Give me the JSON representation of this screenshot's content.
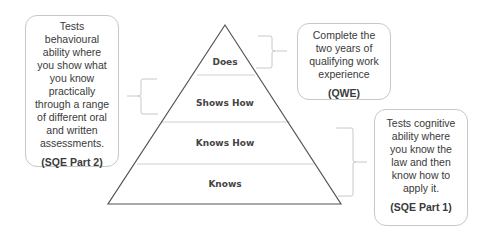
{
  "pyramid": {
    "levels": [
      {
        "label": "Does"
      },
      {
        "label": "Shows How"
      },
      {
        "label": "Knows How"
      },
      {
        "label": "Knows"
      }
    ]
  },
  "callouts": {
    "left": {
      "lines": [
        "Tests",
        "behavioural",
        "ability where",
        "you show what",
        "you know",
        "practically",
        "through a range",
        "of different oral",
        "and written",
        "assessments."
      ],
      "tag": "(SQE Part 2)"
    },
    "top_right": {
      "lines": [
        "Complete the",
        "two years of",
        "qualifying work",
        "experience"
      ],
      "tag": "(QWE)"
    },
    "bottom_right": {
      "lines": [
        "Tests cognitive",
        "ability where",
        "you know the",
        "law and then",
        "know how to",
        "apply it."
      ],
      "tag": "(SQE Part 1)"
    }
  },
  "colors": {
    "outline": "#555555",
    "divider": "#d0d0d0",
    "bracket": "#c8c8c8",
    "box_border": "#c8c8c8"
  }
}
